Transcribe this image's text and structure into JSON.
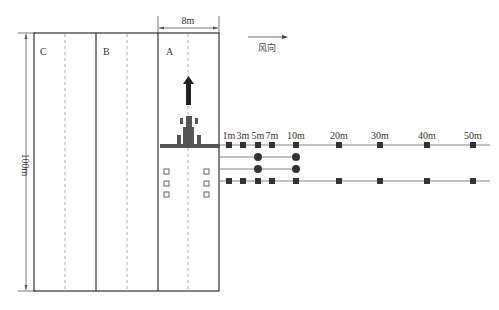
{
  "diagram": {
    "lanes": [
      {
        "id": "C",
        "label": "C"
      },
      {
        "id": "B",
        "label": "B"
      },
      {
        "id": "A",
        "label": "A"
      }
    ],
    "lane_width_label": "8m",
    "field_length_label": "100m",
    "wind": {
      "label": "风向",
      "direction": "right"
    },
    "sampling_distances": [
      "1m",
      "3m",
      "5m",
      "7m",
      "10m",
      "20m",
      "30m",
      "40m",
      "50m"
    ],
    "rows": [
      {
        "name": "top-row",
        "marker": "square",
        "points": [
          "1m",
          "3m",
          "5m",
          "7m",
          "10m",
          "20m",
          "30m",
          "40m",
          "50m"
        ]
      },
      {
        "name": "circle-row-1",
        "marker": "circle",
        "points": [
          "5m",
          "10m"
        ]
      },
      {
        "name": "circle-row-2",
        "marker": "circle",
        "points": [
          "5m",
          "10m"
        ]
      },
      {
        "name": "bottom-row",
        "marker": "square",
        "points": [
          "1m",
          "3m",
          "5m",
          "7m",
          "10m",
          "20m",
          "30m",
          "40m",
          "50m"
        ]
      }
    ],
    "in_lane_samplers": {
      "marker": "hollow-square",
      "columns": 2,
      "rows": 3
    },
    "sprayer": {
      "direction": "up",
      "color": "#333333"
    },
    "colors": {
      "line": "#333333",
      "dashed": "#999999",
      "marker": "#333333",
      "boom": "#555555"
    }
  },
  "caption": {
    "text": ""
  }
}
